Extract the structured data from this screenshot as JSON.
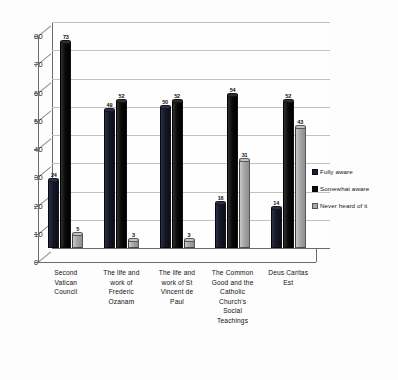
{
  "chart_data": {
    "type": "bar",
    "title": "",
    "xlabel": "",
    "ylabel": "",
    "ylim": [
      0,
      80
    ],
    "yticks": [
      "0",
      "10",
      "20",
      "30",
      "40",
      "50",
      "60",
      "70",
      "80"
    ],
    "grid": true,
    "legend_position": "right",
    "categories": [
      "Second Vatican Council",
      "The life and work of Frederic Ozanam",
      "The life and work of St Vincent de Paul",
      "The Common Good and the Catholic Church's Social Teachings",
      "Deus Caritas Est"
    ],
    "category_lines": [
      [
        "Second",
        "Vatican",
        "Council"
      ],
      [
        "The life and",
        "work of",
        "Frederic",
        "Ozanam"
      ],
      [
        "The life and",
        "work of St",
        "Vincent de",
        "Paul"
      ],
      [
        "The Common",
        "Good and the",
        "Catholic",
        "Church's",
        "Social",
        "Teachings"
      ],
      [
        "Deus Caritas",
        "Est"
      ]
    ],
    "series": [
      {
        "name": "Fully aware",
        "color": "#1a1d2e",
        "values": [
          24,
          49,
          50,
          16,
          14
        ]
      },
      {
        "name": "Somewhat aware",
        "color": "#0a0a0a",
        "values": [
          73,
          52,
          52,
          54,
          52
        ]
      },
      {
        "name": "Never heard of it",
        "color": "#a8a8a8",
        "values": [
          5,
          3,
          3,
          31,
          43
        ]
      }
    ]
  },
  "legend": {
    "items": [
      {
        "label": "Fully aware"
      },
      {
        "label": "Somewhat aware"
      },
      {
        "label": "Never heard of it"
      }
    ]
  }
}
